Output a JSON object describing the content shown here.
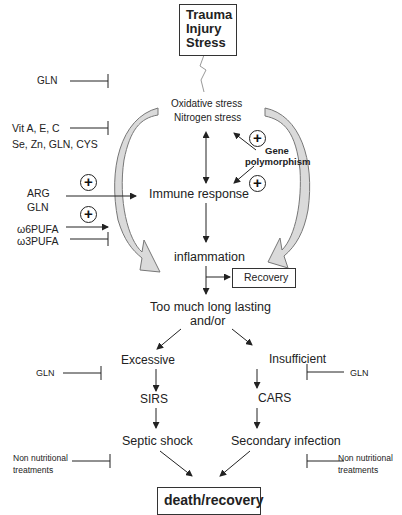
{
  "top_box": {
    "lines": [
      "Trauma",
      "Injury",
      "Stress"
    ]
  },
  "center": {
    "oxidative": "Oxidative stress",
    "nitrogen": "Nitrogen stress",
    "immune": "Immune response",
    "inflammation": "inflammation",
    "recovery": "Recovery",
    "too_much_1": "Too much long lasting",
    "too_much_2": "and/or",
    "excessive": "Excessive",
    "insufficient": "Insufficient",
    "sirs": "SIRS",
    "cars": "CARS",
    "septic": "Septic shock",
    "secondary": "Secondary infection",
    "outcome": "death/recovery"
  },
  "gene": {
    "line1": "Gene",
    "line2": "polymorphism",
    "plus": "+"
  },
  "left_inputs": {
    "gln_top": "GLN",
    "vit": "Vit A, E, C",
    "minerals": "Se, Zn, GLN, CYS",
    "arg": "ARG",
    "gln_mid": "GLN",
    "w6": "ω6PUFA",
    "w3": "ω3PUFA",
    "plus": "+",
    "gln_excessive": "GLN",
    "non_nutr_1": "Non nutritional",
    "non_nutr_2": "treatments"
  },
  "right_inputs": {
    "gln_insufficient": "GLN",
    "non_nutr_1": "Non nutritional",
    "non_nutr_2": "treatments"
  },
  "colors": {
    "line": "#222222",
    "arrow_fill": "#d9d9d9",
    "arrow_stroke": "#777777"
  }
}
